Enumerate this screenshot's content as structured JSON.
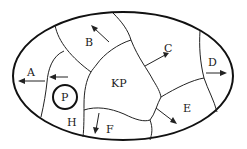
{
  "diagram": {
    "labels": {
      "A": "A",
      "B": "B",
      "C": "C",
      "D": "D",
      "E": "E",
      "F": "F",
      "H": "H",
      "KP": "KP",
      "P": "P"
    },
    "colors": {
      "stroke": "#222222",
      "background": "#ffffff"
    }
  }
}
